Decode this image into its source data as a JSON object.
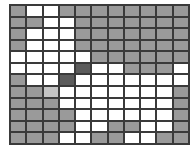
{
  "grid": {
    "columns": 11,
    "rows": 12,
    "legend": {
      "G": "gray",
      "W": "white",
      "D": "dark",
      "L": "light-gray"
    },
    "colors": {
      "G": "#9a9a9a",
      "W": "#ffffff",
      "D": "#5c5c5c",
      "L": "#c4c4c4",
      "line": "#3a3a3a"
    },
    "cells": [
      [
        "G",
        "W",
        "W",
        "G",
        "G",
        "G",
        "G",
        "G",
        "G",
        "G",
        "G"
      ],
      [
        "G",
        "G",
        "W",
        "W",
        "G",
        "G",
        "G",
        "G",
        "G",
        "G",
        "G"
      ],
      [
        "G",
        "W",
        "W",
        "W",
        "G",
        "G",
        "G",
        "G",
        "G",
        "G",
        "G"
      ],
      [
        "G",
        "W",
        "W",
        "W",
        "G",
        "G",
        "G",
        "G",
        "G",
        "G",
        "G"
      ],
      [
        "W",
        "W",
        "W",
        "W",
        "W",
        "G",
        "G",
        "G",
        "G",
        "G",
        "G"
      ],
      [
        "W",
        "W",
        "W",
        "W",
        "D",
        "W",
        "W",
        "G",
        "G",
        "G",
        "W"
      ],
      [
        "G",
        "W",
        "W",
        "D",
        "W",
        "W",
        "W",
        "W",
        "W",
        "W",
        "W"
      ],
      [
        "G",
        "G",
        "L",
        "W",
        "W",
        "W",
        "W",
        "W",
        "W",
        "W",
        "G"
      ],
      [
        "G",
        "G",
        "G",
        "W",
        "W",
        "W",
        "W",
        "W",
        "W",
        "W",
        "G"
      ],
      [
        "G",
        "G",
        "G",
        "G",
        "W",
        "W",
        "W",
        "W",
        "W",
        "W",
        "G"
      ],
      [
        "G",
        "G",
        "G",
        "G",
        "W",
        "W",
        "G",
        "G",
        "W",
        "W",
        "G"
      ],
      [
        "G",
        "G",
        "G",
        "W",
        "W",
        "G",
        "G",
        "W",
        "W",
        "G",
        "G"
      ]
    ]
  }
}
